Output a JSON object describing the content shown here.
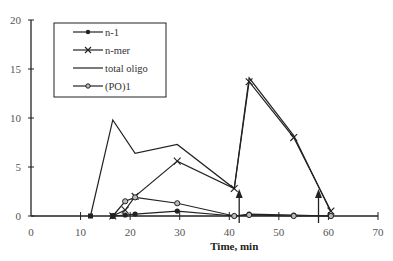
{
  "chart_data": {
    "type": "line",
    "title": "",
    "xlabel": "Time, min",
    "ylabel": "",
    "xlim": [
      0,
      70
    ],
    "ylim": [
      0,
      20
    ],
    "xticks": [
      0,
      10,
      20,
      30,
      40,
      50,
      60,
      70
    ],
    "yticks": [
      0,
      5,
      10,
      15,
      20
    ],
    "grid": false,
    "legend_position": "upper-left (boxed)",
    "series": [
      {
        "name": "n-1",
        "marker": "filled-circle",
        "x": [
          16.5,
          19,
          21,
          29.5,
          41,
          44,
          53,
          60.5
        ],
        "values": [
          0,
          0.1,
          0.2,
          0.5,
          0,
          0.2,
          0.1,
          0
        ]
      },
      {
        "name": "n-mer",
        "marker": "x",
        "x": [
          16.5,
          19,
          21,
          29.5,
          41,
          44,
          53,
          60.5
        ],
        "values": [
          0,
          0.6,
          2.0,
          5.6,
          2.8,
          13.7,
          8.0,
          0.5
        ]
      },
      {
        "name": "total oligo",
        "marker": "none",
        "x": [
          12,
          16.5,
          21,
          29.5,
          41,
          44,
          53,
          60.5
        ],
        "values": [
          0,
          9.8,
          6.4,
          7.3,
          2.8,
          14.1,
          8.2,
          0.4
        ]
      },
      {
        "name": "(PO)1",
        "marker": "open-circle",
        "x": [
          16.5,
          19,
          21,
          29.5,
          41,
          44,
          53,
          60.5
        ],
        "values": [
          0,
          1.5,
          1.9,
          1.3,
          0,
          0.1,
          0,
          0
        ]
      }
    ],
    "baseline_markers": {
      "x": [
        12,
        16.5
      ],
      "values": [
        0,
        0
      ]
    },
    "annotations": [
      {
        "type": "arrow-up",
        "x": 42,
        "label": ""
      },
      {
        "type": "arrow-up",
        "x": 58,
        "label": ""
      }
    ]
  }
}
